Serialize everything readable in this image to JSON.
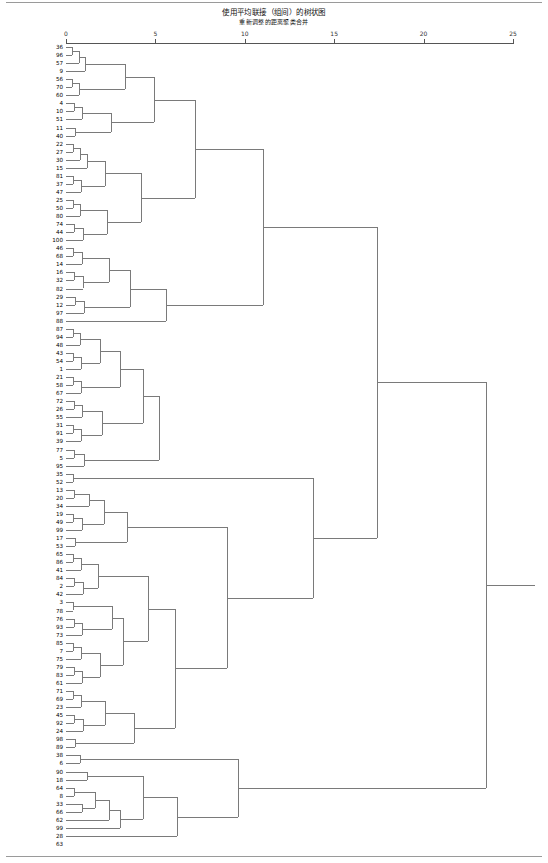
{
  "chart_data": {
    "type": "dendrogram",
    "title": "使用平均联接（组间）的树状图",
    "subtitle": "重新调整的距离聚类合并",
    "xlabel": "",
    "ylabel": "",
    "xlim": [
      0,
      25
    ],
    "ticks": [
      0,
      5,
      10,
      15,
      20,
      25
    ],
    "grid": false,
    "legend": "none",
    "linkage": "average-between-groups",
    "n_leaves": 100,
    "leaves": [
      {
        "label": "鸡爪枫",
        "num": 36
      },
      {
        "label": "鱼木",
        "num": 96
      },
      {
        "label": "猫尾木",
        "num": 57
      },
      {
        "label": "大琴叶榕",
        "num": 9
      },
      {
        "label": "麻楝",
        "num": 56
      },
      {
        "label": "秋枫",
        "num": 70
      },
      {
        "label": "蓝花树",
        "num": 60
      },
      {
        "label": "源槁树",
        "num": 4
      },
      {
        "label": "大王椰",
        "num": 10
      },
      {
        "label": "柳叶榕",
        "num": 51
      },
      {
        "label": "大叶榄仁",
        "num": 11
      },
      {
        "label": "假苹婆",
        "num": 40
      },
      {
        "label": "海红豆",
        "num": 22
      },
      {
        "label": "红花天料木",
        "num": 27
      },
      {
        "label": "红花玉蕊",
        "num": 30
      },
      {
        "label": "凤凰木",
        "num": 15
      },
      {
        "label": "糖胶树",
        "num": 81
      },
      {
        "label": "鸡蛋花",
        "num": 37
      },
      {
        "label": "盆花槿",
        "num": 47
      },
      {
        "label": "海南蒲桃",
        "num": 25
      },
      {
        "label": "蓝雪",
        "num": 50
      },
      {
        "label": "台湾相思",
        "num": 80
      },
      {
        "label": "石栗",
        "num": 74
      },
      {
        "label": "黄钟花",
        "num": 44
      },
      {
        "label": "紫檀",
        "num": 100
      },
      {
        "label": "腊肠树",
        "num": 46
      },
      {
        "label": "菩提榕",
        "num": 68
      },
      {
        "label": "非洲楝",
        "num": 14
      },
      {
        "label": "福建山樱花",
        "num": 16
      },
      {
        "label": "大叶榕",
        "num": 32
      },
      {
        "label": "铁刀木",
        "num": 82
      },
      {
        "label": "红花紫荆",
        "num": 29
      },
      {
        "label": "大叶山楝",
        "num": 12
      },
      {
        "label": "爪哇木棉",
        "num": 97
      },
      {
        "label": "橡胶榕",
        "num": 88
      },
      {
        "label": "象腿树",
        "num": 87
      },
      {
        "label": "银海枣",
        "num": 94
      },
      {
        "label": "老人葵",
        "num": 48
      },
      {
        "label": "金山葵",
        "num": 43
      },
      {
        "label": "罗汉松",
        "num": 54
      },
      {
        "label": "霸王棕",
        "num": 1
      },
      {
        "label": "槟榔椰子",
        "num": 21
      },
      {
        "label": "美丽针葵",
        "num": 58
      },
      {
        "label": "蒲葵",
        "num": 67
      },
      {
        "label": "三角椰子",
        "num": 72
      },
      {
        "label": "红刺露兜树",
        "num": 26
      },
      {
        "label": "落羽杉",
        "num": 55
      },
      {
        "label": "狐尾椰",
        "num": 31
      },
      {
        "label": "椰子",
        "num": 91
      },
      {
        "label": "假槟榔",
        "num": 39
      },
      {
        "label": "水松",
        "num": 77
      },
      {
        "label": "池杉",
        "num": 5
      },
      {
        "label": "油棕",
        "num": 95
      },
      {
        "label": "鸡冠刺桐",
        "num": 35
      },
      {
        "label": "龙眼",
        "num": 52
      },
      {
        "label": "短穗鱼尾葵",
        "num": 13
      },
      {
        "label": "四季桂",
        "num": 20
      },
      {
        "label": "黄金香柳",
        "num": 34
      },
      {
        "label": "广玉兰",
        "num": 19
      },
      {
        "label": "荔枝",
        "num": 49
      },
      {
        "label": "中国无忧花",
        "num": 99
      },
      {
        "label": "高山榕",
        "num": 17
      },
      {
        "label": "尾锞妹",
        "num": 53
      },
      {
        "label": "苹婆",
        "num": 65
      },
      {
        "label": "香樟",
        "num": 86
      },
      {
        "label": "尖叶杜英",
        "num": 41
      },
      {
        "label": "五棱果",
        "num": 84
      },
      {
        "label": "白千层",
        "num": 2
      },
      {
        "label": "降香黄檀",
        "num": 42
      },
      {
        "label": "菠罗蜜",
        "num": 3
      },
      {
        "label": "水石榕",
        "num": 78
      },
      {
        "label": "水翁",
        "num": 76
      },
      {
        "label": "阴香",
        "num": 93
      },
      {
        "label": "散尾葵",
        "num": 73
      },
      {
        "label": "五月茶",
        "num": 85
      },
      {
        "label": "垂枝红千层",
        "num": 7
      },
      {
        "label": "水黄皮",
        "num": 75
      },
      {
        "label": "复羽叶栾树",
        "num": 79
      },
      {
        "label": "铁冬青",
        "num": 83
      },
      {
        "label": "幂氏榄仁",
        "num": 61
      },
      {
        "label": "人面子",
        "num": 71
      },
      {
        "label": "朴树",
        "num": 69
      },
      {
        "label": "海南菜豆树",
        "num": 23
      },
      {
        "label": "苋楝",
        "num": 45
      },
      {
        "label": "异叶南洋杉",
        "num": 92
      },
      {
        "label": "海南红豆",
        "num": 24
      },
      {
        "label": "蒲桃",
        "num": 98
      },
      {
        "label": "小叶榄仁",
        "num": 89
      },
      {
        "label": "黄槿",
        "num": 38
      },
      {
        "label": "秦叶密",
        "num": 6
      },
      {
        "label": "小叶榕",
        "num": 90
      },
      {
        "label": "富贵羊蹄甲",
        "num": 18
      },
      {
        "label": "南洋楹",
        "num": 64
      },
      {
        "label": "大花紫薇",
        "num": 8
      },
      {
        "label": "黄花风铃木",
        "num": 33
      },
      {
        "label": "美丽异木棉",
        "num": 66
      },
      {
        "label": "木棉黄",
        "num": 62
      },
      {
        "label": "紫花风铃木",
        "num": 99
      },
      {
        "label": "红花羊蹄甲",
        "num": 28
      },
      {
        "label": "木棉",
        "num": 63
      }
    ],
    "axis_px": {
      "x0": 66,
      "x25": 513
    },
    "links": [
      {
        "a": 0,
        "b": 1,
        "d": 0.35
      },
      {
        "a": 101,
        "b": 2,
        "d": 0.7
      },
      {
        "a": 102,
        "b": 3,
        "d": 1.05
      },
      {
        "a": 4,
        "b": 5,
        "d": 0.35
      },
      {
        "a": 104,
        "b": 6,
        "d": 0.75
      },
      {
        "a": 103,
        "b": 105,
        "d": 3.3
      },
      {
        "a": 7,
        "b": 8,
        "d": 0.45
      },
      {
        "a": 107,
        "b": 9,
        "d": 0.9
      },
      {
        "a": 10,
        "b": 11,
        "d": 0.5
      },
      {
        "a": 108,
        "b": 109,
        "d": 2.5
      },
      {
        "a": 106,
        "b": 110,
        "d": 4.9
      },
      {
        "a": 12,
        "b": 13,
        "d": 0.4
      },
      {
        "a": 112,
        "b": 14,
        "d": 0.8
      },
      {
        "a": 113,
        "b": 15,
        "d": 1.15
      },
      {
        "a": 16,
        "b": 17,
        "d": 0.4
      },
      {
        "a": 115,
        "b": 18,
        "d": 0.85
      },
      {
        "a": 114,
        "b": 116,
        "d": 2.2
      },
      {
        "a": 19,
        "b": 20,
        "d": 0.4
      },
      {
        "a": 118,
        "b": 21,
        "d": 0.8
      },
      {
        "a": 22,
        "b": 23,
        "d": 0.45
      },
      {
        "a": 120,
        "b": 24,
        "d": 0.95
      },
      {
        "a": 119,
        "b": 121,
        "d": 2.3
      },
      {
        "a": 117,
        "b": 122,
        "d": 4.2
      },
      {
        "a": 111,
        "b": 123,
        "d": 7.2
      },
      {
        "a": 25,
        "b": 26,
        "d": 0.4
      },
      {
        "a": 125,
        "b": 27,
        "d": 0.9
      },
      {
        "a": 28,
        "b": 29,
        "d": 0.45
      },
      {
        "a": 127,
        "b": 30,
        "d": 0.95
      },
      {
        "a": 126,
        "b": 128,
        "d": 2.4
      },
      {
        "a": 31,
        "b": 32,
        "d": 0.5
      },
      {
        "a": 130,
        "b": 33,
        "d": 1.0
      },
      {
        "a": 129,
        "b": 131,
        "d": 3.6
      },
      {
        "a": 132,
        "b": 34,
        "d": 5.6
      },
      {
        "a": 124,
        "b": 133,
        "d": 11.0
      },
      {
        "a": 35,
        "b": 36,
        "d": 0.4
      },
      {
        "a": 135,
        "b": 37,
        "d": 0.8
      },
      {
        "a": 38,
        "b": 39,
        "d": 0.4
      },
      {
        "a": 137,
        "b": 40,
        "d": 0.85
      },
      {
        "a": 136,
        "b": 138,
        "d": 1.9
      },
      {
        "a": 41,
        "b": 42,
        "d": 0.4
      },
      {
        "a": 140,
        "b": 43,
        "d": 0.85
      },
      {
        "a": 139,
        "b": 141,
        "d": 3.0
      },
      {
        "a": 44,
        "b": 45,
        "d": 0.45
      },
      {
        "a": 143,
        "b": 46,
        "d": 0.9
      },
      {
        "a": 47,
        "b": 48,
        "d": 0.4
      },
      {
        "a": 145,
        "b": 49,
        "d": 0.85
      },
      {
        "a": 144,
        "b": 146,
        "d": 2.0
      },
      {
        "a": 142,
        "b": 147,
        "d": 4.3
      },
      {
        "a": 50,
        "b": 51,
        "d": 0.45
      },
      {
        "a": 149,
        "b": 52,
        "d": 1.0
      },
      {
        "a": 148,
        "b": 150,
        "d": 5.2
      },
      {
        "a": 53,
        "b": 54,
        "d": 0.4
      },
      {
        "a": 55,
        "b": 56,
        "d": 0.45
      },
      {
        "a": 153,
        "b": 57,
        "d": 1.3
      },
      {
        "a": 58,
        "b": 59,
        "d": 0.4
      },
      {
        "a": 155,
        "b": 60,
        "d": 0.9
      },
      {
        "a": 154,
        "b": 156,
        "d": 2.1
      },
      {
        "a": 61,
        "b": 62,
        "d": 0.5
      },
      {
        "a": 157,
        "b": 158,
        "d": 3.4
      },
      {
        "a": 63,
        "b": 64,
        "d": 0.4
      },
      {
        "a": 160,
        "b": 65,
        "d": 0.85
      },
      {
        "a": 66,
        "b": 67,
        "d": 0.45
      },
      {
        "a": 162,
        "b": 68,
        "d": 0.95
      },
      {
        "a": 161,
        "b": 163,
        "d": 1.8
      },
      {
        "a": 69,
        "b": 70,
        "d": 0.4
      },
      {
        "a": 71,
        "b": 72,
        "d": 0.45
      },
      {
        "a": 166,
        "b": 73,
        "d": 0.9
      },
      {
        "a": 165,
        "b": 167,
        "d": 2.6
      },
      {
        "a": 74,
        "b": 75,
        "d": 0.4
      },
      {
        "a": 169,
        "b": 76,
        "d": 0.85
      },
      {
        "a": 77,
        "b": 78,
        "d": 0.45
      },
      {
        "a": 171,
        "b": 79,
        "d": 0.9
      },
      {
        "a": 170,
        "b": 172,
        "d": 1.9
      },
      {
        "a": 168,
        "b": 173,
        "d": 3.2
      },
      {
        "a": 164,
        "b": 174,
        "d": 4.6
      },
      {
        "a": 80,
        "b": 81,
        "d": 0.4
      },
      {
        "a": 176,
        "b": 82,
        "d": 0.85
      },
      {
        "a": 83,
        "b": 84,
        "d": 0.45
      },
      {
        "a": 178,
        "b": 85,
        "d": 0.95
      },
      {
        "a": 177,
        "b": 179,
        "d": 2.2
      },
      {
        "a": 86,
        "b": 87,
        "d": 0.5
      },
      {
        "a": 180,
        "b": 181,
        "d": 3.8
      },
      {
        "a": 175,
        "b": 182,
        "d": 6.1
      },
      {
        "a": 159,
        "b": 183,
        "d": 9.0
      },
      {
        "a": 152,
        "b": 184,
        "d": 13.8
      },
      {
        "a": 134,
        "b": 185,
        "d": 17.4
      },
      {
        "a": 88,
        "b": 89,
        "d": 0.8
      },
      {
        "a": 90,
        "b": 91,
        "d": 1.2
      },
      {
        "a": 92,
        "b": 93,
        "d": 0.45
      },
      {
        "a": 94,
        "b": 95,
        "d": 0.9
      },
      {
        "a": 189,
        "b": 190,
        "d": 1.6
      },
      {
        "a": 191,
        "b": 96,
        "d": 2.4
      },
      {
        "a": 192,
        "b": 97,
        "d": 3.0
      },
      {
        "a": 188,
        "b": 193,
        "d": 4.3
      },
      {
        "a": 194,
        "b": 98,
        "d": 6.2
      },
      {
        "a": 187,
        "b": 195,
        "d": 9.6
      },
      {
        "a": 186,
        "b": 196,
        "d": 23.5
      }
    ]
  }
}
